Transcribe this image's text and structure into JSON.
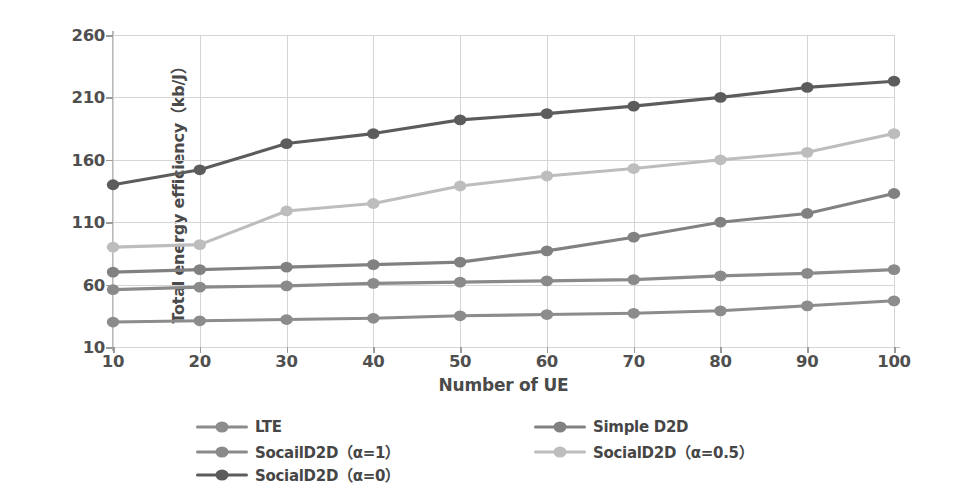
{
  "chart_data": {
    "type": "line",
    "title": "",
    "xlabel": "Number of UE",
    "ylabel": "Total energy efficiency（kb/J）",
    "x": [
      10,
      20,
      30,
      40,
      50,
      60,
      70,
      80,
      90,
      100
    ],
    "xlim": [
      10,
      100
    ],
    "ylim": [
      10,
      260
    ],
    "xticks": [
      "10",
      "20",
      "30",
      "40",
      "50",
      "60",
      "70",
      "80",
      "90",
      "100"
    ],
    "yticks": [
      "10",
      "60",
      "110",
      "160",
      "210",
      "260"
    ],
    "grid": true,
    "legend_position": "below-axes",
    "series": [
      {
        "name": "LTE",
        "color": "#8c8c8c",
        "values": [
          30,
          31,
          32,
          33,
          35,
          36,
          37,
          39,
          43,
          47
        ]
      },
      {
        "name": "Simple D2D",
        "color": "#818181",
        "values": [
          70,
          72,
          74,
          76,
          78,
          87,
          98,
          110,
          117,
          133
        ]
      },
      {
        "name": "SocailD2D（α=1）",
        "color": "#8a8a8a",
        "values": [
          56,
          58,
          59,
          61,
          62,
          63,
          64,
          67,
          69,
          72
        ]
      },
      {
        "name": "SocialD2D（α=0.5）",
        "color": "#bdbdbd",
        "values": [
          90,
          92,
          119,
          125,
          139,
          147,
          153,
          160,
          166,
          181
        ]
      },
      {
        "name": "SocialD2D（α=0）",
        "color": "#5c5c5c",
        "values": [
          140,
          152,
          173,
          181,
          192,
          197,
          203,
          210,
          218,
          223
        ]
      }
    ]
  },
  "legend": {
    "entries": [
      {
        "label": "LTE",
        "series_index": 0,
        "col": 0,
        "row": 0
      },
      {
        "label": "SocailD2D（α=1）",
        "series_index": 2,
        "col": 0,
        "row": 1
      },
      {
        "label": "SocialD2D（α=0）",
        "series_index": 4,
        "col": 0,
        "row": 2
      },
      {
        "label": "Simple D2D",
        "series_index": 1,
        "col": 1,
        "row": 0
      },
      {
        "label": "SocialD2D（α=0.5）",
        "series_index": 3,
        "col": 1,
        "row": 1
      }
    ]
  },
  "colors": {
    "grid": "#d5d5d5",
    "axis": "#b9b9b9",
    "text": "#4a4a4a",
    "background": "#ffffff"
  }
}
